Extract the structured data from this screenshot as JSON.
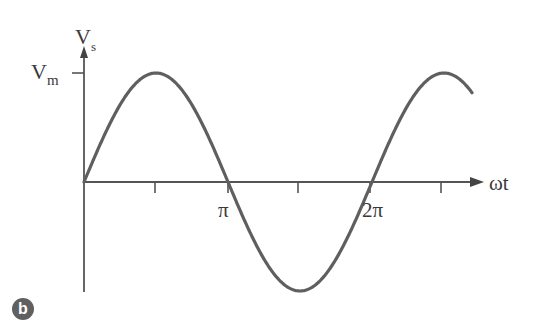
{
  "diagram": {
    "type": "sine-waveform",
    "y_axis": {
      "label_main": "V",
      "label_sub": "s"
    },
    "y_marker": {
      "label_main": "V",
      "label_sub": "m"
    },
    "x_axis": {
      "label": "ωt"
    },
    "x_ticks": [
      "π",
      "2π"
    ],
    "badge": "b",
    "colors": {
      "curve": "#5f5f5f",
      "axis": "#555555",
      "text": "#3a3a3a",
      "badge": "#606060"
    }
  },
  "chart_data": {
    "type": "line",
    "title": "",
    "xlabel": "ωt",
    "ylabel": "Vs",
    "function": "Vs = Vm·sin(ωt)",
    "x_tick_labels": [
      "π",
      "2π"
    ],
    "y_tick_labels": [
      "Vm"
    ],
    "x_range_radians": [
      0,
      5.4
    ],
    "y_range": [
      -1,
      1
    ],
    "series": [
      {
        "name": "Vs",
        "x": [
          0,
          1.5708,
          3.1416,
          4.7124,
          6.2832,
          7.854,
          8.5
        ],
        "values": [
          0,
          1,
          0,
          -1,
          0,
          1,
          0.8
        ]
      }
    ]
  }
}
